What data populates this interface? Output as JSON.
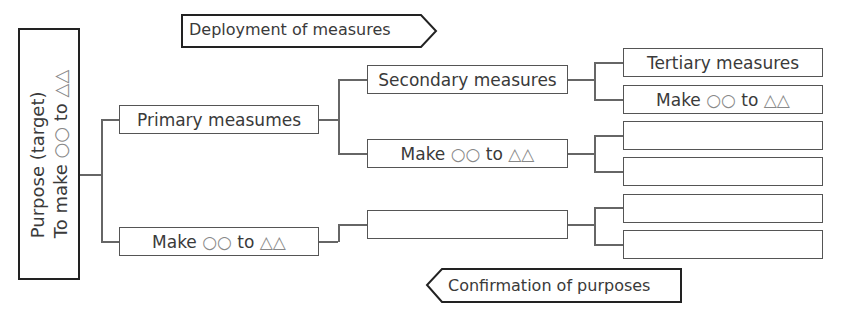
{
  "purpose": {
    "line1": "Purpose (target)",
    "line2_prefix": "To make ",
    "line2_circles": "○○",
    "line2_mid": " to ",
    "line2_triangles": "△△"
  },
  "deployment_arrow": {
    "label": "Deployment of measures",
    "direction": "right"
  },
  "confirmation_arrow": {
    "label": "Confirmation of purposes",
    "direction": "left"
  },
  "primary": [
    {
      "label": "Primary measumes"
    },
    {
      "prefix": "Make ",
      "circles": "○○",
      "mid": " to ",
      "triangles": "△△"
    }
  ],
  "secondary": [
    {
      "label": "Secondary measures"
    },
    {
      "prefix": "Make ",
      "circles": "○○",
      "mid": " to ",
      "triangles": "△△"
    },
    {
      "label": ""
    }
  ],
  "tertiary": [
    {
      "label": "Tertiary measures"
    },
    {
      "prefix": "Make ",
      "circles": "○○",
      "mid": " to ",
      "triangles": "△△"
    },
    {
      "label": ""
    },
    {
      "label": ""
    },
    {
      "label": ""
    },
    {
      "label": ""
    }
  ],
  "colors": {
    "border": "#555555",
    "purpose_border": "#222222",
    "text": "#3a3a3a",
    "symbol": "#888888"
  }
}
